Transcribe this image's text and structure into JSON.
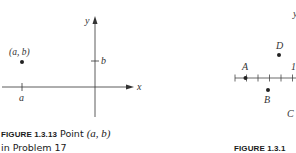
{
  "figure_left": {
    "id_label": "FIGURE 1.3.13",
    "caption_text_1": "Point",
    "caption_math": "(a, b)",
    "caption_line_2": "in Problem 17",
    "point_label": "(a, b)",
    "x_tick_label": "a",
    "y_tick_label": "b",
    "x_axis_label": "x",
    "y_axis_label": "y"
  },
  "figure_right": {
    "id_label": "FIGURE 1.3.1",
    "y_axis_label": "y",
    "tick_label_one": "1",
    "points": [
      {
        "name": "A"
      },
      {
        "name": "B"
      },
      {
        "name": "C"
      },
      {
        "name": "D"
      }
    ]
  },
  "colors": {
    "ink": "#333333",
    "caption": "#1a1a1a",
    "background": "#ffffff"
  }
}
